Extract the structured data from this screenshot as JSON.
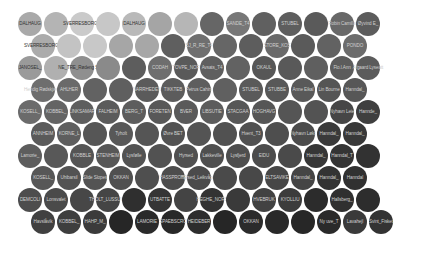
{
  "chart_data": {
    "type": "bubble-grid",
    "title": "",
    "layout": {
      "rows": 10,
      "row_y": [
        24,
        46,
        68,
        90,
        112,
        134,
        156,
        178,
        200,
        222
      ],
      "even_row_start_x": 30,
      "odd_row_start_x": 43,
      "step_x": 26,
      "diameter": 24
    },
    "rows": [
      {
        "shades": [
          "#a9a9a9",
          "#b4b4b4",
          "#cacaca",
          "#c7c7c7",
          "#b9b9b9",
          "#a5a5a5",
          "#b6b6b6",
          "#666666",
          "#777777",
          "#606060",
          "#5e5e5e",
          "#5a5a5a",
          "#686868",
          "#5c5c5c"
        ],
        "labels": [
          "DALHAUG",
          "",
          "SVERRESBORG_I",
          "",
          "DALHAUG",
          "",
          "",
          "",
          "SANDE_T4",
          "",
          "STUBEL",
          "",
          "Robin Camilla",
          "Øyvind E_"
        ]
      },
      {
        "shades": [
          "#ababab",
          "#c3c3c3",
          "#c8c8c8",
          "#a6a6a6",
          "#a7a7a7",
          "#5f5f5f",
          "#6f6f6f",
          "#666666",
          "#5d5d5d",
          "#6a6a6a",
          "#5a5a5a",
          "#626262",
          "#6c6c6c"
        ],
        "labels": [
          "SVERRESBORG_I",
          "",
          "",
          "",
          "",
          "",
          "BJ_R_RE_T4",
          "",
          "",
          "STORE_KOS",
          "",
          "",
          "PONDO"
        ]
      },
      {
        "shades": [
          "#9a9a9a",
          "#b0b0b0",
          "#8f8f8f",
          "#8a8a8a",
          "#5d5d5d",
          "#6e6e6e",
          "#5a5a5a",
          "#5f5f5f",
          "#626262",
          "#575757",
          "#595959",
          "#5f5f5f",
          "#5c5c5c",
          "#5b5b5b"
        ],
        "labels": [
          "JANOSEL_",
          "",
          "NE_TRE_Rødeng Sorte",
          "",
          "",
          "CODAH",
          "TOVPE_NOR",
          "Avsats_T4",
          "",
          "OKAUL",
          "",
          "",
          "Flo.l.Ann",
          "Afgaard Lyseatt"
        ]
      },
      {
        "shades": [
          "#6e6e6e",
          "#6a6a6a",
          "#626262",
          "#5f5f5f",
          "#5b5b5b",
          "#5c5c5c",
          "#5e5e5e",
          "#606060",
          "#5a5a5a",
          "#585858",
          "#595959",
          "#555555",
          "#575757"
        ],
        "labels": [
          "Hendig Rødskjæret",
          "AHLHER",
          "",
          "",
          "NARRHEDEN",
          "TIKKTEB",
          "Petrus Cahim",
          "",
          "STUBEL",
          "STUBBE",
          "Anne Eikal",
          "Lin Bourne",
          "Hanndal_"
        ]
      },
      {
        "shades": [
          "#6b6b6b",
          "#646464",
          "#5e5e5e",
          "#5b5b5b",
          "#5d5d5d",
          "#585858",
          "#5a5a5a",
          "#5c5c5c",
          "#575757",
          "#565656",
          "#555555",
          "#535353",
          "#464646",
          "#3f3f3f"
        ],
        "labels": [
          "KOSELL_",
          "KOBBEL_",
          "LINKSAMAR",
          "FALHEIM",
          "BERG_T",
          "FORETEN",
          "BVER",
          "LIBSUTIE",
          "STACGAA",
          "HOGHAVG",
          "",
          "",
          "Nyhavn Leie",
          "Hannde_"
        ]
      },
      {
        "shades": [
          "#5a5a5a",
          "#5e5e5e",
          "#565656",
          "#585858",
          "#555555",
          "#525252",
          "#545454",
          "#515151",
          "#505050",
          "#4e4e4e",
          "#4b4b4b",
          "#3a3a3a",
          "#383838"
        ],
        "labels": [
          "ANNHEIM",
          "KORNE_L",
          "",
          "Tyholt",
          "",
          "Øvre BET",
          "",
          "",
          "Hvent_T3",
          "",
          "Nyhavn Løkt",
          "Hanndal_",
          "Hanndal_"
        ]
      },
      {
        "shades": [
          "#5d5d5d",
          "#585858",
          "#555555",
          "#575757",
          "#535353",
          "#525252",
          "#505050",
          "#4f4f4f",
          "#4e4e4e",
          "#4c4c4c",
          "#4a4a4a",
          "#363636",
          "#343434",
          "#323232"
        ],
        "labels": [
          "Lamorie_",
          "",
          "KOBBLE",
          "STENHEIM",
          "Lysfølle",
          "",
          "Hyrsed",
          "Lakkeville",
          "Lysfjerd",
          "EIDU",
          "",
          "Hanndal_",
          "Hanndal_T",
          ""
        ]
      },
      {
        "shades": [
          "#575757",
          "#535353",
          "#545454",
          "#505050",
          "#4f4f4f",
          "#4d4d4d",
          "#4b4b4b",
          "#4a4a4a",
          "#484848",
          "#474747",
          "#454545",
          "#333333",
          "#313131"
        ],
        "labels": [
          "KOSELL_",
          "Uhibarsil",
          "Slide Slopes",
          "OKKAN",
          "",
          "HASSPROTE",
          "Hyrsed_Leikvågen",
          "",
          "",
          "ELTSAVIKE",
          "Hanndal_",
          "Hanndal_",
          "Hanndal"
        ]
      },
      {
        "shades": [
          "#4d4d4d",
          "#4a4a4a",
          "#474747",
          "#454545",
          "#2f2f2f",
          "#353535",
          "#444444",
          "#333333",
          "#3a3a3a",
          "#424242",
          "#3c3c3c",
          "#2c2c2c",
          "#303030",
          "#2d2d2d"
        ],
        "labels": [
          "DEMCOLI",
          "Lonsvalet",
          "",
          "THOLT_LUSSUVG",
          "",
          "UTBATTE",
          "",
          "HEGHE_NORS",
          "",
          "HVEBRUK",
          "KYOLLIU",
          "",
          "Hallsberg_",
          ""
        ]
      },
      {
        "shades": [
          "#404040",
          "#3e3e3e",
          "#3b3b3b",
          "#262626",
          "#2a2a2a",
          "#282828",
          "#2d2d2d",
          "#262626",
          "#2b2b2b",
          "#292929",
          "#272727",
          "#2a2a2a",
          "#3a3a3a",
          "#333333"
        ],
        "labels": [
          "Havslåvik",
          "KOBBEL_",
          "HAHP_M_",
          "",
          "LAMORIE",
          "SPAEBSCRO",
          "HEIDEBER",
          "",
          "OKKAN",
          "",
          "",
          "Ny uve_T",
          "Lavahejl",
          "Svint_Fisket"
        ]
      }
    ],
    "label_color_dark_on_light": "#333333",
    "label_color_light_on_dark": "#cfcfcf"
  }
}
